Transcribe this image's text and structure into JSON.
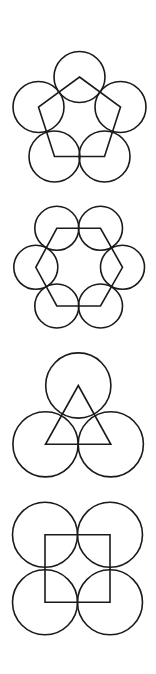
{
  "canvas": {
    "width": 156,
    "height": 674,
    "background": "#ffffff"
  },
  "style": {
    "stroke": "#1a1a1a",
    "stroke_width": 1.6
  },
  "figures": [
    {
      "name": "pentagon-figure",
      "polygon": "pentagon",
      "vertices": [
        [
          79.5,
          77
        ],
        [
          120.5,
          107
        ],
        [
          104.5,
          156.5
        ],
        [
          54.5,
          156.5
        ],
        [
          38.5,
          107
        ]
      ],
      "circle_radius": 25.5
    },
    {
      "name": "hexagon-figure",
      "polygon": "hexagon",
      "vertices": [
        [
          56.8,
          228.3
        ],
        [
          100.5,
          228.3
        ],
        [
          122.5,
          267.3
        ],
        [
          100.5,
          306
        ],
        [
          56.8,
          306
        ],
        [
          35.8,
          267.3
        ]
      ],
      "circle_radius": 22
    },
    {
      "name": "triangle-figure",
      "polygon": "triangle",
      "vertices": [
        [
          78.3,
          385.5
        ],
        [
          110.8,
          444.3
        ],
        [
          45.5,
          444.3
        ]
      ],
      "circle_radius": 32.6
    },
    {
      "name": "square-figure",
      "polygon": "square",
      "vertices": [
        [
          45,
          534.8
        ],
        [
          110,
          534.8
        ],
        [
          110,
          602.3
        ],
        [
          45,
          602.3
        ]
      ],
      "circle_radius": 32.5
    }
  ]
}
